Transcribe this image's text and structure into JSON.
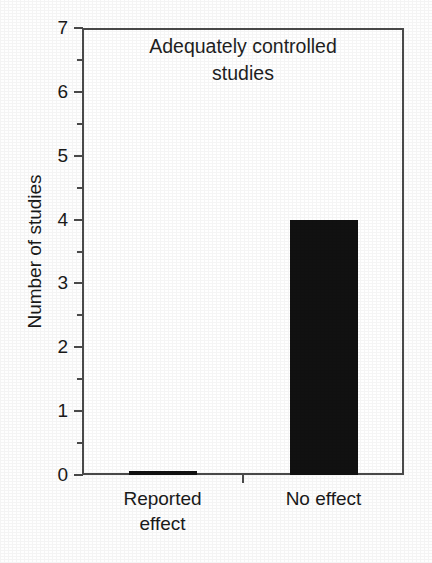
{
  "chart_data": {
    "type": "bar",
    "title": "Adequately controlled studies",
    "title_lines": [
      "Adequately controlled",
      "studies"
    ],
    "xlabel": "",
    "ylabel": "Number of studies",
    "categories": [
      "Reported effect",
      "No effect"
    ],
    "category_lines": [
      [
        "Reported",
        "effect"
      ],
      [
        "No effect"
      ]
    ],
    "values": [
      0,
      4
    ],
    "ylim": [
      0,
      7
    ],
    "ytick_labels": [
      "0",
      "1",
      "2",
      "3",
      "4",
      "5",
      "6",
      "7"
    ],
    "ytick_values": [
      0,
      1,
      2,
      3,
      4,
      5,
      6,
      7
    ],
    "yminor_values": [
      0.5,
      1.5,
      2.5,
      3.5,
      4.5,
      5.5,
      6.5
    ],
    "grid": false,
    "legend": false,
    "bar_color": "#111111",
    "axis_color": "#4a4a4a",
    "background_color": "#ffffff",
    "text_color": "#1a1a1a"
  }
}
